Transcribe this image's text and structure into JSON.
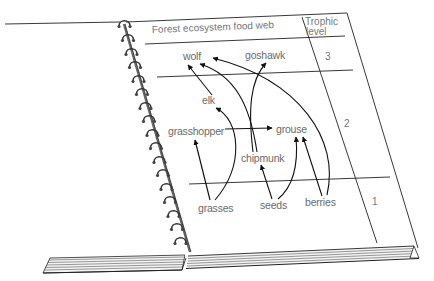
{
  "diagram": {
    "title": "Forest ecosystem food web",
    "column_header": [
      "Trophic",
      "level"
    ],
    "levels": [
      {
        "number": "3",
        "organisms": [
          "wolf",
          "goshawk"
        ]
      },
      {
        "number": "2",
        "organisms": [
          "elk",
          "grasshopper",
          "grouse",
          "chipmunk"
        ]
      },
      {
        "number": "1",
        "organisms": [
          "grasses",
          "seeds",
          "berries"
        ]
      }
    ],
    "labels": {
      "wolf": "wolf",
      "goshawk": "goshawk",
      "elk": "elk",
      "grasshopper": "grasshopper",
      "grouse": "grouse",
      "chipmunk": "chipmunk",
      "grasses": "grasses",
      "seeds": "seeds",
      "berries": "berries",
      "level3": "3",
      "level2": "2",
      "level1": "1",
      "header_line1": "Trophic",
      "header_line2": "level"
    },
    "edges": [
      {
        "from": "grasses",
        "to": "grasshopper"
      },
      {
        "from": "grasses",
        "to": "elk"
      },
      {
        "from": "elk",
        "to": "wolf"
      },
      {
        "from": "chipmunk",
        "to": "wolf"
      },
      {
        "from": "chipmunk",
        "to": "goshawk"
      },
      {
        "from": "grasshopper",
        "to": "grouse"
      },
      {
        "from": "seeds",
        "to": "chipmunk"
      },
      {
        "from": "seeds",
        "to": "grouse"
      },
      {
        "from": "berries",
        "to": "grouse"
      },
      {
        "from": "berries",
        "to": "wolf"
      }
    ],
    "style": {
      "line_color": "#1a1a1a",
      "text_color": "#6a6a6a",
      "background": "#ffffff"
    }
  }
}
